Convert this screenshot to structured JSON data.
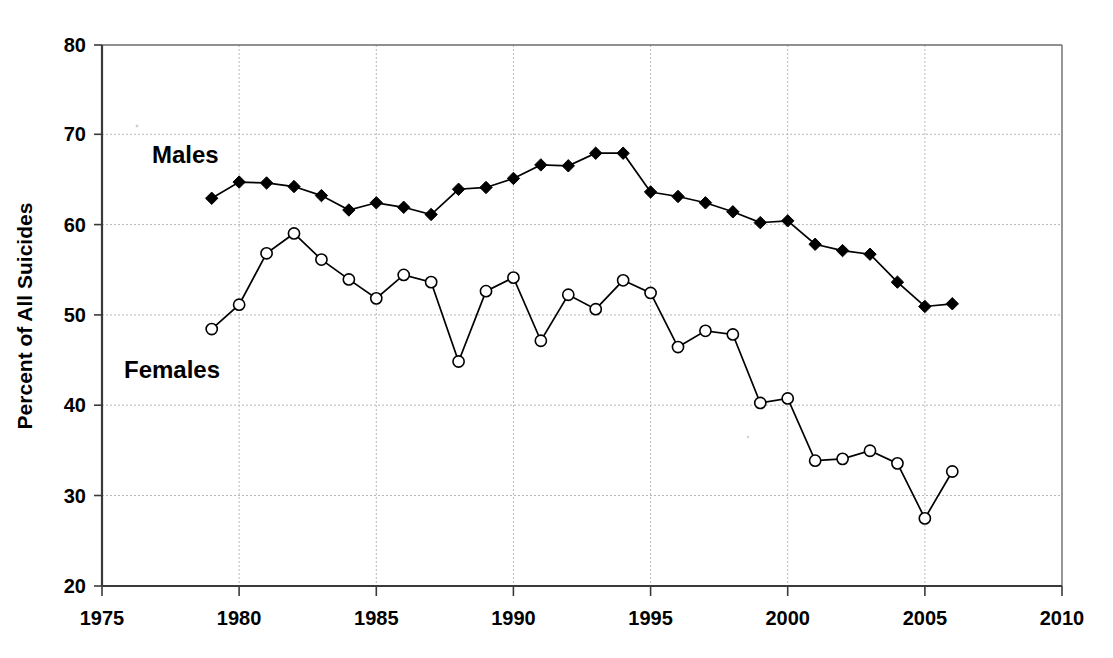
{
  "chart_data": {
    "type": "line",
    "title": "",
    "subtitle": "",
    "xlabel": "",
    "ylabel": "Percent of All Suicides",
    "xlim": [
      1975,
      2010
    ],
    "ylim": [
      20,
      80
    ],
    "xticks": [
      1975,
      1980,
      1985,
      1990,
      1995,
      2000,
      2005,
      2010
    ],
    "yticks": [
      20,
      30,
      40,
      50,
      60,
      70,
      80
    ],
    "grid": "dotted horizontal and vertical gridlines at major ticks",
    "legend_position": "inline annotations on plot",
    "annotations": [
      {
        "text": "Males",
        "x": 1980.3,
        "y": 68.5
      },
      {
        "text": "Females",
        "x": 1979.5,
        "y": 44.0
      }
    ],
    "x": [
      1979,
      1980,
      1981,
      1982,
      1983,
      1984,
      1985,
      1986,
      1987,
      1988,
      1989,
      1990,
      1991,
      1992,
      1993,
      1994,
      1995,
      1996,
      1997,
      1998,
      1999,
      2000,
      2001,
      2002,
      2003,
      2004,
      2005,
      2006
    ],
    "series": [
      {
        "name": "Males",
        "marker": "filled-diamond",
        "values": [
          63.0,
          64.8,
          64.7,
          64.3,
          63.3,
          61.7,
          62.5,
          62.0,
          61.2,
          64.0,
          64.2,
          65.2,
          66.7,
          66.6,
          68.0,
          68.0,
          63.7,
          63.2,
          62.5,
          61.5,
          60.3,
          60.5,
          57.9,
          57.2,
          56.8,
          53.7,
          51.0,
          51.3
        ]
      },
      {
        "name": "Females",
        "marker": "open-circle",
        "values": [
          48.5,
          51.2,
          56.9,
          59.1,
          56.2,
          54.0,
          51.9,
          54.5,
          53.7,
          44.9,
          52.7,
          54.2,
          47.2,
          52.3,
          50.7,
          53.9,
          52.5,
          46.5,
          48.3,
          47.9,
          40.3,
          40.8,
          33.9,
          34.1,
          35.0,
          33.6,
          27.5,
          32.7
        ]
      }
    ]
  },
  "labels": {
    "y_axis_title": "Percent of All Suicides",
    "males": "Males",
    "females": "Females",
    "ytick_20": "20",
    "ytick_30": "30",
    "ytick_40": "40",
    "ytick_50": "50",
    "ytick_60": "60",
    "ytick_70": "70",
    "ytick_80": "80",
    "xtick_1975": "1975",
    "xtick_1980": "1980",
    "xtick_1985": "1985",
    "xtick_1990": "1990",
    "xtick_1995": "1995",
    "xtick_2000": "2000",
    "xtick_2005": "2005",
    "xtick_2010": "2010"
  },
  "colors": {
    "series_stroke": "#000000",
    "grid": "#b9b9b9",
    "axis": "#3a3a3a",
    "background": "#ffffff"
  }
}
